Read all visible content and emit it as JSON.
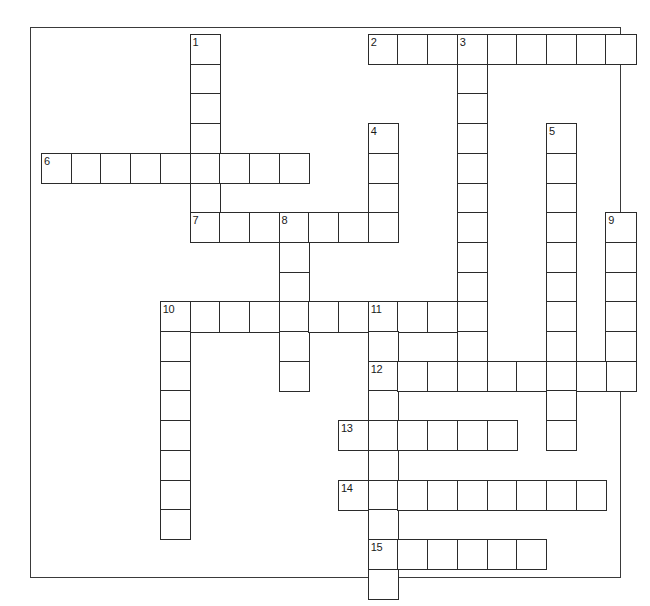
{
  "puzzle": {
    "title": "Crossword Grid",
    "type": "crossword",
    "cell_size": 29.7,
    "origin_x": 40,
    "origin_y": 33,
    "frame": {
      "x": 30,
      "y": 27,
      "width": 591,
      "height": 551,
      "border_color": "#3a3a3a"
    },
    "cell_border_color": "#2b2b2b",
    "cell_fill_color": "#ffffff",
    "background_color": "#ffffff",
    "number_color": "#1a1a1a",
    "columns": 20,
    "rows": 19,
    "entries": [
      {
        "number": "1",
        "direction": "down",
        "col": 5,
        "row": 0,
        "length": 7
      },
      {
        "number": "2",
        "direction": "across",
        "col": 11,
        "row": 0,
        "length": 9
      },
      {
        "number": "3",
        "direction": "down",
        "col": 14,
        "row": 0,
        "length": 11
      },
      {
        "number": "4",
        "direction": "down",
        "col": 11,
        "row": 3,
        "length": 4
      },
      {
        "number": "5",
        "direction": "down",
        "col": 17,
        "row": 3,
        "length": 11
      },
      {
        "number": "6",
        "direction": "across",
        "col": 0,
        "row": 4,
        "length": 9
      },
      {
        "number": "7",
        "direction": "across",
        "col": 5,
        "row": 6,
        "length": 7
      },
      {
        "number": "8",
        "direction": "down",
        "col": 8,
        "row": 6,
        "length": 6
      },
      {
        "number": "9",
        "direction": "down",
        "col": 19,
        "row": 6,
        "length": 6
      },
      {
        "number": "10",
        "direction": "across",
        "col": 4,
        "row": 9,
        "length": 11
      },
      {
        "number": "10",
        "direction": "down",
        "col": 4,
        "row": 9,
        "length": 8
      },
      {
        "number": "11",
        "direction": "down",
        "col": 11,
        "row": 9,
        "length": 10
      },
      {
        "number": "12",
        "direction": "across",
        "col": 11,
        "row": 11,
        "length": 9
      },
      {
        "number": "13",
        "direction": "across",
        "col": 10,
        "row": 13,
        "length": 6
      },
      {
        "number": "14",
        "direction": "across",
        "col": 10,
        "row": 15,
        "length": 9
      },
      {
        "number": "15",
        "direction": "across",
        "col": 11,
        "row": 17,
        "length": 6
      }
    ],
    "numbered_cells": [
      {
        "label": "1",
        "col": 5,
        "row": 0
      },
      {
        "label": "2",
        "col": 11,
        "row": 0
      },
      {
        "label": "3",
        "col": 14,
        "row": 0
      },
      {
        "label": "4",
        "col": 11,
        "row": 3
      },
      {
        "label": "5",
        "col": 17,
        "row": 3
      },
      {
        "label": "6",
        "col": 0,
        "row": 4
      },
      {
        "label": "7",
        "col": 5,
        "row": 6
      },
      {
        "label": "8",
        "col": 8,
        "row": 6
      },
      {
        "label": "9",
        "col": 19,
        "row": 6
      },
      {
        "label": "10",
        "col": 4,
        "row": 9
      },
      {
        "label": "11",
        "col": 11,
        "row": 9
      },
      {
        "label": "12",
        "col": 11,
        "row": 11
      },
      {
        "label": "13",
        "col": 10,
        "row": 13
      },
      {
        "label": "14",
        "col": 10,
        "row": 15
      },
      {
        "label": "15",
        "col": 11,
        "row": 17
      }
    ]
  }
}
